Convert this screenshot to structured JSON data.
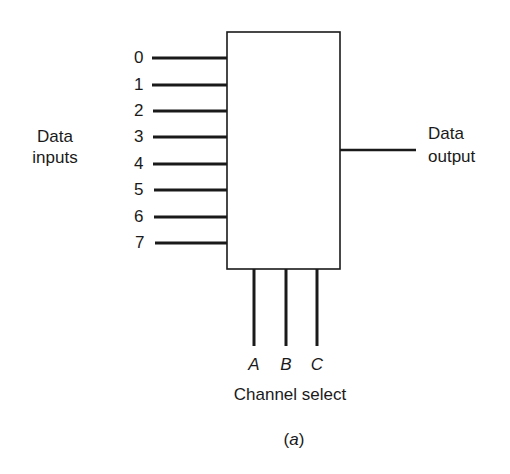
{
  "diagram": {
    "type": "multiplexer-block-diagram",
    "caption": "(a)",
    "caption_letter": "a",
    "input_group_label_line1": "Data",
    "input_group_label_line2": "inputs",
    "output_label_line1": "Data",
    "output_label_line2": "output",
    "select_group_label": "Channel select",
    "inputs": [
      "0",
      "1",
      "2",
      "3",
      "4",
      "5",
      "6",
      "7"
    ],
    "select_lines": [
      "A",
      "B",
      "C"
    ],
    "colors": {
      "line": "#1a1a1a",
      "background": "#ffffff"
    }
  }
}
